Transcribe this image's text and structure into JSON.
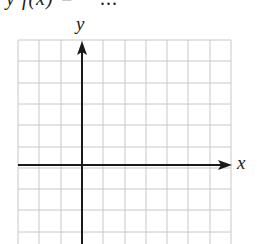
{
  "header": {
    "cropped_text": "y f(x)  =  − ..."
  },
  "graph": {
    "x_label": "x",
    "y_label": "y",
    "grid": {
      "columns": 10,
      "rows_visible": 10,
      "cell_px": 21.3,
      "origin_column": 3,
      "origin_row_from_top": 6,
      "grid_color": "#c8c8c8",
      "axis_color": "#1a1a1a"
    }
  },
  "chart_data": {
    "type": "line",
    "title": "",
    "xlabel": "x",
    "ylabel": "y",
    "series": [],
    "grid": true,
    "xlim": [
      -3,
      7
    ],
    "ylim": [
      -4,
      6
    ]
  }
}
